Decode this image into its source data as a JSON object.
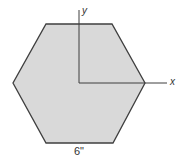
{
  "diagram": {
    "shape": "regular-hexagon",
    "colors": {
      "fill": "#d9d9d9",
      "stroke": "#3f3f3f",
      "axis": "#3f3f3f"
    },
    "axes": {
      "x_label": "x",
      "y_label": "y"
    },
    "dimension": {
      "side_length_label": "6\""
    }
  }
}
